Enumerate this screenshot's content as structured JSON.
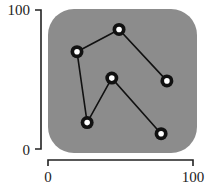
{
  "chart_data": {
    "type": "line",
    "title": "",
    "xlabel": "",
    "ylabel": "",
    "xlim": [
      0,
      100
    ],
    "ylim": [
      0,
      100
    ],
    "grid": false,
    "legend": null,
    "x_ticks": [
      "0",
      "100"
    ],
    "y_ticks": [
      "0",
      "100"
    ],
    "background_panel": {
      "shape": "rounded-square",
      "color": "#8c8c8c"
    },
    "series": [
      {
        "name": "path",
        "color": "#111111",
        "marker": "ring",
        "points": [
          {
            "x": 82,
            "y": 49
          },
          {
            "x": 49,
            "y": 86
          },
          {
            "x": 20,
            "y": 70
          },
          {
            "x": 27,
            "y": 19
          },
          {
            "x": 44,
            "y": 51
          },
          {
            "x": 78,
            "y": 11
          }
        ]
      }
    ]
  },
  "axes": {
    "x": {
      "min_label": "0",
      "max_label": "100"
    },
    "y": {
      "min_label": "0",
      "max_label": "100"
    }
  }
}
